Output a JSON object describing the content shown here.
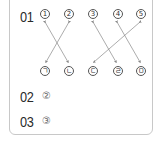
{
  "questions": [
    {
      "number": "01",
      "top_items": [
        "1",
        "2",
        "3",
        "4",
        "5"
      ],
      "bottom_items": [
        "ㄱ",
        "ㄴ",
        "ㄷ",
        "ㄹ",
        "ㅁ"
      ],
      "matches": [
        {
          "from": "1",
          "to": "ㄴ"
        },
        {
          "from": "2",
          "to": "ㄱ"
        },
        {
          "from": "3",
          "to": "ㄹ"
        },
        {
          "from": "4",
          "to": "ㅁ"
        },
        {
          "from": "5",
          "to": "ㄷ"
        }
      ]
    },
    {
      "number": "02",
      "answer": "②"
    },
    {
      "number": "03",
      "answer": "③"
    }
  ],
  "colors": {
    "line": "#888888",
    "border": "#c8c8c8",
    "text": "#2a2a2a"
  }
}
